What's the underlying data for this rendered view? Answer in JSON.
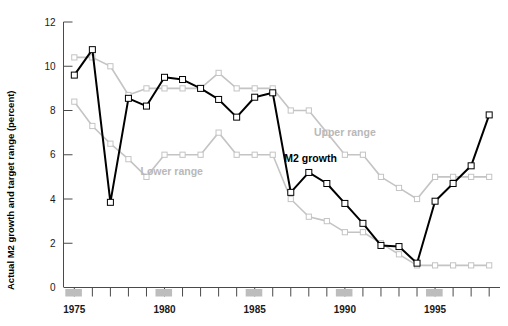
{
  "chart_data": {
    "type": "line",
    "title": "",
    "xlabel": "",
    "ylabel": "Actual M2 growth and target range (percent)",
    "xlim": [
      1974.4,
      1998.6
    ],
    "ylim": [
      0,
      12
    ],
    "yticks": [
      0,
      2,
      4,
      6,
      8,
      10,
      12
    ],
    "ytick_labels": [
      "0",
      "2",
      "4",
      "6",
      "8",
      "10",
      "12"
    ],
    "xticks": [
      1975,
      1976,
      1977,
      1978,
      1979,
      1980,
      1981,
      1982,
      1983,
      1984,
      1985,
      1986,
      1987,
      1988,
      1989,
      1990,
      1991,
      1992,
      1993,
      1994,
      1995,
      1996,
      1997,
      1998
    ],
    "xtick_labels_shown": [
      "1975",
      "1980",
      "1985",
      "1990",
      "1995"
    ],
    "xtick_labels_years": [
      1975,
      1980,
      1985,
      1990,
      1995
    ],
    "grid": false,
    "legend_position": "inline-annotations",
    "x": [
      1975,
      1976,
      1977,
      1978,
      1979,
      1980,
      1981,
      1982,
      1983,
      1984,
      1985,
      1986,
      1987,
      1988,
      1989,
      1990,
      1991,
      1992,
      1993,
      1994,
      1995,
      1996,
      1997,
      1998
    ],
    "series": [
      {
        "name": "M2 growth",
        "color": "#000000",
        "marker": "square-open",
        "values": [
          9.6,
          10.75,
          3.85,
          8.55,
          8.2,
          9.5,
          9.4,
          9.0,
          8.5,
          7.7,
          8.6,
          8.8,
          4.3,
          5.2,
          4.7,
          3.8,
          2.9,
          1.9,
          1.85,
          1.1,
          3.9,
          4.7,
          5.5,
          7.8
        ]
      },
      {
        "name": "Upper range",
        "color": "#c4c4c4",
        "marker": "square-open",
        "values": [
          10.4,
          10.4,
          10.0,
          8.7,
          9.0,
          9.0,
          9.0,
          9.0,
          9.7,
          9.0,
          9.0,
          9.0,
          8.0,
          8.0,
          7.0,
          6.0,
          6.0,
          5.0,
          4.5,
          4.0,
          5.0,
          5.0,
          5.0,
          5.0
        ]
      },
      {
        "name": "Lower range",
        "color": "#c4c4c4",
        "marker": "square-open",
        "values": [
          8.4,
          7.3,
          6.5,
          5.8,
          5.0,
          6.0,
          6.0,
          6.0,
          7.0,
          6.0,
          6.0,
          6.0,
          4.0,
          3.2,
          3.0,
          2.5,
          2.5,
          2.0,
          1.5,
          1.0,
          1.0,
          1.0,
          1.0,
          1.0
        ]
      }
    ],
    "annotations": [
      {
        "text": "Upper range",
        "x": 1990.0,
        "y": 6.85,
        "color": "#b8b8b8"
      },
      {
        "text": "M2 growth",
        "x": 1988.1,
        "y": 5.65,
        "color": "#000000"
      },
      {
        "text": "Lower range",
        "x": 1980.4,
        "y": 5.1,
        "color": "#b8b8b8"
      }
    ],
    "axis_bands": {
      "description": "shaded gray bands on x-axis marking labeled years",
      "color": "#bdbdbd",
      "years": [
        1975,
        1980,
        1985,
        1990,
        1995
      ]
    }
  },
  "axis": {
    "y_title": "Actual M2 growth and target range (percent)"
  }
}
